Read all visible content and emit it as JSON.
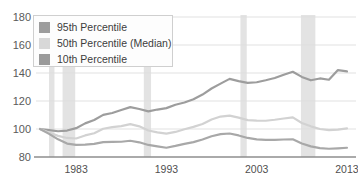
{
  "chart_data": {
    "type": "line",
    "title": "",
    "xlabel": "",
    "ylabel": "",
    "xlim": [
      1979,
      2014
    ],
    "ylim": [
      80,
      180
    ],
    "grid": true,
    "ytick_labels": [
      "180",
      "160",
      "140",
      "120",
      "100",
      "80"
    ],
    "yticks": [
      180,
      160,
      140,
      120,
      100,
      80
    ],
    "xtick_labels": [
      "1983",
      "1993",
      "2003",
      "2013"
    ],
    "xticks": [
      1983,
      1993,
      2003,
      2013
    ],
    "legend_position": "top-left",
    "x": [
      1979,
      1980,
      1981,
      1982,
      1983,
      1984,
      1985,
      1986,
      1987,
      1988,
      1989,
      1990,
      1991,
      1992,
      1993,
      1994,
      1995,
      1996,
      1997,
      1998,
      1999,
      2000,
      2001,
      2002,
      2003,
      2004,
      2005,
      2006,
      2007,
      2008,
      2009,
      2010,
      2011,
      2012,
      2013
    ],
    "series": [
      {
        "name": "95th Percentile",
        "color": "#9d9d9d",
        "values": [
          100.0,
          99.2,
          98.4,
          98.9,
          100.6,
          104.0,
          106.4,
          110.1,
          111.4,
          113.6,
          115.6,
          114.3,
          112.6,
          113.9,
          114.9,
          117.3,
          118.9,
          121.3,
          124.6,
          128.9,
          132.4,
          135.8,
          134.2,
          132.9,
          133.4,
          134.8,
          136.4,
          138.8,
          140.9,
          137.2,
          134.8,
          136.1,
          135.2,
          142.1,
          141.1
        ]
      },
      {
        "name": "50th Percentile (Median)",
        "color": "#d2d2d2",
        "values": [
          100.0,
          97.4,
          95.1,
          93.6,
          93.2,
          95.4,
          97.0,
          100.2,
          101.3,
          102.1,
          103.5,
          101.9,
          98.9,
          97.6,
          96.7,
          97.9,
          99.8,
          101.5,
          103.6,
          106.8,
          108.9,
          109.6,
          108.1,
          106.3,
          106.0,
          105.9,
          106.6,
          107.5,
          108.3,
          104.3,
          101.9,
          100.0,
          99.2,
          99.5,
          100.4
        ]
      },
      {
        "name": "10th Percentile",
        "color": "#a8a8a8",
        "values": [
          100.0,
          96.5,
          92.6,
          89.6,
          88.6,
          88.9,
          89.4,
          90.6,
          90.8,
          90.9,
          91.6,
          90.5,
          88.6,
          87.6,
          86.6,
          87.9,
          89.4,
          90.6,
          92.5,
          94.8,
          96.3,
          96.8,
          95.4,
          93.6,
          92.6,
          92.2,
          92.3,
          92.5,
          92.6,
          89.6,
          87.6,
          86.3,
          85.9,
          86.2,
          86.6
        ]
      }
    ],
    "recession_bands": [
      {
        "start": 1980.0,
        "end": 1980.6
      },
      {
        "start": 1981.5,
        "end": 1982.9
      },
      {
        "start": 1990.5,
        "end": 1991.3
      },
      {
        "start": 2001.2,
        "end": 2001.9
      },
      {
        "start": 2007.9,
        "end": 2009.5
      }
    ],
    "band_color": "#e3e3e3"
  },
  "legend": {
    "items": [
      {
        "label": "95th Percentile",
        "color": "#9d9d9d"
      },
      {
        "label": "50th Percentile (Median)",
        "color": "#d8d8d8"
      },
      {
        "label": "10th Percentile",
        "color": "#9a9a9a"
      }
    ]
  },
  "ghost_title": ""
}
